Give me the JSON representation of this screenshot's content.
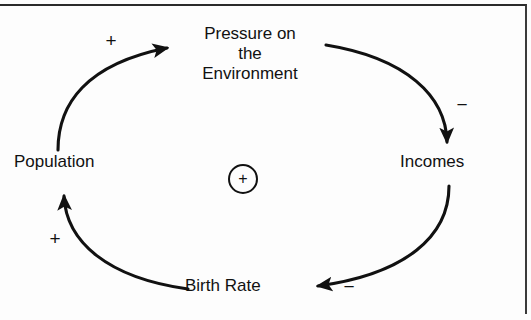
{
  "figure": {
    "type": "causal-loop-diagram",
    "loop_polarity": "+",
    "stroke_color": "#111111",
    "background_color": "#fdfdfd"
  },
  "nodes": [
    {
      "id": "pressure",
      "label": "Pressure on\nthe\nEnvironment"
    },
    {
      "id": "incomes",
      "label": "Incomes"
    },
    {
      "id": "birth_rate",
      "label": "Birth Rate"
    },
    {
      "id": "population",
      "label": "Population"
    }
  ],
  "links": [
    {
      "id": "population_to_pressure",
      "from": "Population",
      "to": "Pressure on the Environment",
      "polarity": "+"
    },
    {
      "id": "pressure_to_incomes",
      "from": "Pressure on the Environment",
      "to": "Incomes",
      "polarity": "−"
    },
    {
      "id": "incomes_to_birth_rate",
      "from": "Incomes",
      "to": "Birth Rate",
      "polarity": "−"
    },
    {
      "id": "birth_rate_to_population",
      "from": "Birth Rate",
      "to": "Population",
      "polarity": "+"
    }
  ],
  "center_marker": {
    "sign": "+",
    "meaning": "reinforcing loop"
  }
}
